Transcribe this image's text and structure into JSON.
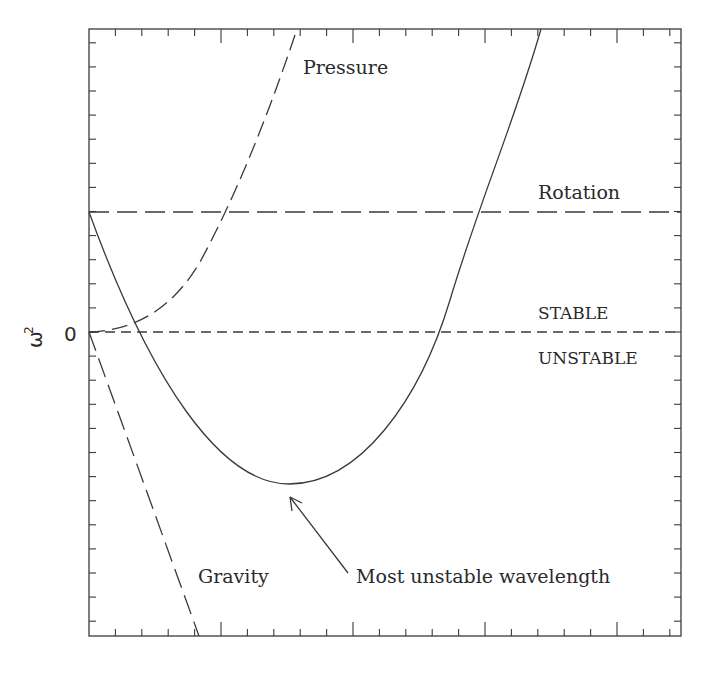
{
  "chart_data": {
    "type": "line",
    "title": "",
    "xlabel": "",
    "ylabel": "ω²",
    "ytick_labels": [
      "0"
    ],
    "grid": false,
    "legend": "none (curves labelled inline)",
    "frame_px": {
      "left": 89,
      "top": 29,
      "right": 681,
      "bottom": 636
    },
    "x_axis": {
      "major_ticks_px": [
        221,
        353,
        485,
        617
      ],
      "minor_tick_spacing_px": 26.4,
      "labels": "none"
    },
    "y_axis": {
      "zero_px": 332,
      "minor_tick_spacing_px": 24.1,
      "labels": [
        "0"
      ]
    },
    "series": [
      {
        "name": "Rotation",
        "style": "long-dash",
        "kind": "horizontal line",
        "description": "constant positive ω² (≈ +5 y-tick units above zero)"
      },
      {
        "name": "STABLE / UNSTABLE boundary",
        "style": "short-dash",
        "kind": "horizontal line at ω² = 0"
      },
      {
        "name": "Pressure",
        "style": "dash",
        "kind": "rising curve ∝ k², starts at 0, exits top of frame"
      },
      {
        "name": "Gravity",
        "style": "long-dash",
        "kind": "falling line ∝ −k, starts at 0, exits bottom of frame"
      },
      {
        "name": "Total dispersion",
        "style": "solid",
        "kind": "parabola: Rotation + Pressure + Gravity",
        "description": "starts at Rotation level, dips negative, minimum at 'Most unstable wavelength', then rises above zero"
      }
    ],
    "annotations": [
      {
        "text": "Pressure",
        "position": "top center"
      },
      {
        "text": "Rotation",
        "position": "right, above rotation line"
      },
      {
        "text": "STABLE",
        "position": "right, above zero line"
      },
      {
        "text": "UNSTABLE",
        "position": "right, below zero line"
      },
      {
        "text": "Gravity",
        "position": "lower left"
      },
      {
        "text": "Most unstable wavelength",
        "position": "lower center",
        "arrow_to": "minimum of solid curve"
      }
    ]
  },
  "labels": {
    "y_axis_symbol": "ω",
    "y_axis_exponent": "2",
    "y_zero": "0",
    "pressure": "Pressure",
    "rotation": "Rotation",
    "stable": "STABLE",
    "unstable": "UNSTABLE",
    "gravity": "Gravity",
    "most_unstable": "Most unstable wavelength"
  },
  "colors": {
    "line": "#3a3a3a",
    "text": "#2a2a2a",
    "background": "#ffffff"
  }
}
